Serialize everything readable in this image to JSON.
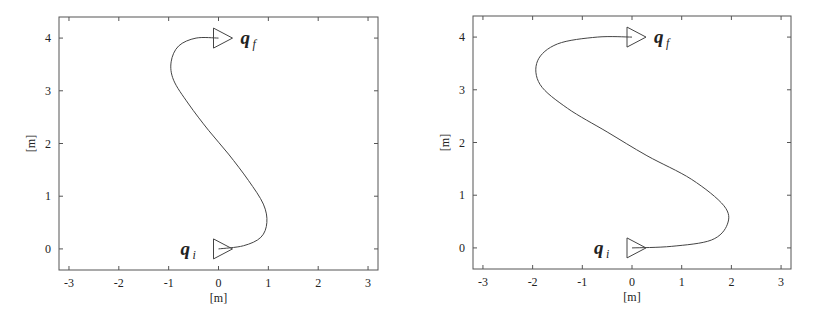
{
  "chart_data": [
    {
      "type": "line",
      "title": "",
      "xlabel": "[m]",
      "ylabel": "[m]",
      "xlim": [
        -3.2,
        3.2
      ],
      "ylim": [
        -0.4,
        4.4
      ],
      "xticks": [
        -3,
        -2,
        -1,
        0,
        1,
        2,
        3
      ],
      "yticks": [
        0,
        1,
        2,
        3,
        4
      ],
      "grid": false,
      "legend": null,
      "series": [
        {
          "name": "path",
          "x": [
            0.0,
            0.5,
            0.85,
            0.97,
            0.9,
            0.6,
            0.2,
            -0.2,
            -0.6,
            -0.9,
            -0.95,
            -0.8,
            -0.45,
            0.0
          ],
          "y": [
            0.0,
            0.06,
            0.22,
            0.5,
            0.85,
            1.3,
            1.8,
            2.25,
            2.75,
            3.2,
            3.55,
            3.85,
            4.0,
            4.0
          ]
        }
      ],
      "annotations": [
        {
          "text": "q_i",
          "label_main": "q",
          "label_sub": "i",
          "x": 0,
          "y": 0,
          "marker": "triangle-right"
        },
        {
          "text": "q_f",
          "label_main": "q",
          "label_sub": "f",
          "x": 0,
          "y": 4,
          "marker": "triangle-right"
        }
      ]
    },
    {
      "type": "line",
      "title": "",
      "xlabel": "[m]",
      "ylabel": "[m]",
      "xlim": [
        -3.2,
        3.2
      ],
      "ylim": [
        -0.4,
        4.4
      ],
      "xticks": [
        -3,
        -2,
        -1,
        0,
        1,
        2,
        3
      ],
      "yticks": [
        0,
        1,
        2,
        3,
        4
      ],
      "grid": false,
      "legend": null,
      "series": [
        {
          "name": "path",
          "x": [
            0.0,
            0.8,
            1.6,
            1.92,
            1.85,
            1.2,
            0.3,
            -0.5,
            -1.3,
            -1.85,
            -1.9,
            -1.5,
            -0.7,
            0.0
          ],
          "y": [
            0.0,
            0.03,
            0.15,
            0.45,
            0.8,
            1.3,
            1.75,
            2.2,
            2.65,
            3.1,
            3.55,
            3.87,
            4.0,
            4.0
          ]
        }
      ],
      "annotations": [
        {
          "text": "q_i",
          "label_main": "q",
          "label_sub": "i",
          "x": 0,
          "y": 0,
          "marker": "triangle-right"
        },
        {
          "text": "q_f",
          "label_main": "q",
          "label_sub": "f",
          "x": 0,
          "y": 4,
          "marker": "triangle-right"
        }
      ]
    }
  ],
  "style": {
    "axis_color": "#555555",
    "line_color": "#444444",
    "background": "#ffffff"
  }
}
